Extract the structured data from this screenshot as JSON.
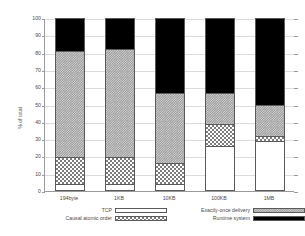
{
  "chart_data": {
    "type": "bar",
    "stacked": true,
    "title": "",
    "xlabel": "",
    "ylabel": "% of total",
    "ylim": [
      0,
      100
    ],
    "yticks": [
      0,
      10,
      20,
      30,
      40,
      50,
      60,
      70,
      80,
      90,
      100
    ],
    "grid": true,
    "legend_position": "bottom",
    "categories": [
      "194byte",
      "1KB",
      "10KB",
      "100KB",
      "1MB"
    ],
    "series": [
      {
        "name": "TCP",
        "pattern": "empty-white",
        "color": "#ffffff",
        "values": [
          3,
          3,
          3,
          25,
          28
        ]
      },
      {
        "name": "Causal atomic order",
        "pattern": "coarse-checker",
        "color": "#7d7d7d",
        "values": [
          16,
          16,
          12,
          13,
          3
        ]
      },
      {
        "name": "Exactly-once delivery",
        "pattern": "fine-checker-grey",
        "color": "#9c9c9c",
        "values": [
          62,
          63,
          41,
          18,
          18
        ]
      },
      {
        "name": "Runtime system",
        "pattern": "solid-black",
        "color": "#000000",
        "values": [
          19,
          18,
          44,
          44,
          51
        ]
      }
    ]
  },
  "axis": {
    "y_title": "% of total",
    "y_tick_labels": [
      "0",
      "10",
      "20",
      "30",
      "40",
      "50",
      "60",
      "70",
      "80",
      "90",
      "100"
    ],
    "x_tick_labels": [
      "194byte",
      "1KB",
      "10KB",
      "100KB",
      "1MB"
    ]
  },
  "legend": {
    "entries": [
      {
        "label": "TCP",
        "pattern": "empty-white"
      },
      {
        "label": "Causal atomic order",
        "pattern": "coarse-checker"
      },
      {
        "label": "Exactly-once delivery",
        "pattern": "fine-checker-grey"
      },
      {
        "label": "Runtime system",
        "pattern": "solid-black"
      }
    ]
  }
}
